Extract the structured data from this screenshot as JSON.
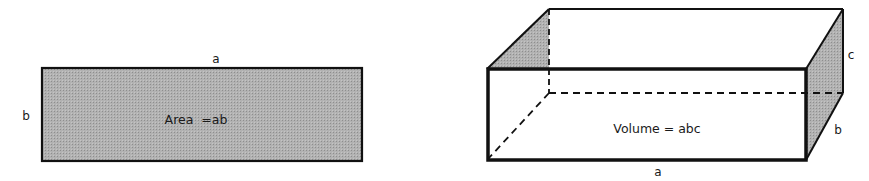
{
  "rectangle": {
    "top_label": "a",
    "side_label": "b",
    "formula": "Area  =ab",
    "fill": "#a9a9a9",
    "stroke": "#111111"
  },
  "box": {
    "bottom_label": "a",
    "depth_label": "b",
    "height_label": "c",
    "formula": "Volume = abc",
    "shade": "#a9a9a9",
    "stroke": "#111111"
  }
}
